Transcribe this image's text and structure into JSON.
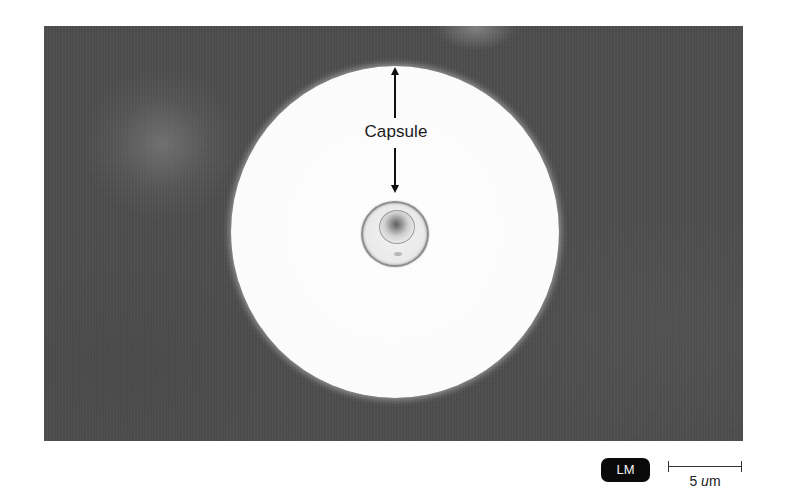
{
  "figure": {
    "type": "light-micrograph",
    "annotation": {
      "label": "Capsule",
      "arrow_up": "arrow-up-to-capsule-edge",
      "arrow_down": "arrow-down-to-cell-wall"
    },
    "badge": {
      "label": "LM"
    },
    "scale_bar": {
      "value": "5",
      "unit_prefix": "u",
      "unit_suffix": "m"
    },
    "colors": {
      "background_field": "#4e4e4e",
      "capsule_halo": "#fbfbfb",
      "badge_background": "#0a0a0a",
      "badge_text": "#f2f2f2",
      "annotation_text": "#1a1a1a"
    }
  }
}
